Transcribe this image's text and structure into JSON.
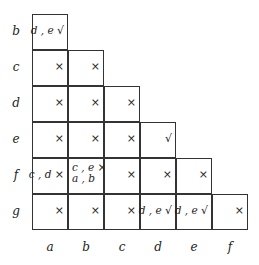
{
  "rows": [
    "b",
    "c",
    "d",
    "e",
    "f",
    "g"
  ],
  "cols": [
    "a",
    "b",
    "c",
    "d",
    "e",
    "f"
  ],
  "marks": {
    "cross": "×",
    "check": "√"
  },
  "cells": [
    [
      {
        "text": "d , e",
        "mark": "√"
      }
    ],
    [
      {
        "text": "",
        "mark": "×"
      },
      {
        "text": "",
        "mark": "×"
      }
    ],
    [
      {
        "text": "",
        "mark": "×"
      },
      {
        "text": "",
        "mark": "×"
      },
      {
        "text": "",
        "mark": "×"
      }
    ],
    [
      {
        "text": "",
        "mark": "×"
      },
      {
        "text": "",
        "mark": "×"
      },
      {
        "text": "",
        "mark": "×"
      },
      {
        "text": "",
        "mark": "√"
      }
    ],
    [
      {
        "text": "c , d",
        "mark": "×"
      },
      {
        "text": "c , e",
        "mark": "×",
        "line2": "a , b"
      },
      {
        "text": "",
        "mark": "×"
      },
      {
        "text": "",
        "mark": "×"
      },
      {
        "text": "",
        "mark": "×"
      }
    ],
    [
      {
        "text": "",
        "mark": "×"
      },
      {
        "text": "",
        "mark": "×"
      },
      {
        "text": "",
        "mark": "×"
      },
      {
        "text": "d , e",
        "mark": "√"
      },
      {
        "text": "d , e",
        "mark": "√"
      },
      {
        "text": "",
        "mark": "×"
      }
    ]
  ]
}
